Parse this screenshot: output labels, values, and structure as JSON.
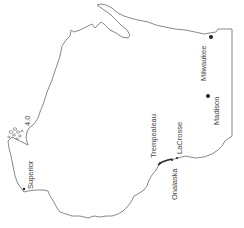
{
  "map": {
    "region": "Wisconsin",
    "orientation": "rotated 90 degrees counter-clockwise",
    "colors": {
      "outline": "#7a7a7a",
      "dot": "#222222",
      "label": "#444444",
      "background": "#ffffff"
    },
    "cities": [
      {
        "name": "Superior",
        "x": 24,
        "y": 189,
        "r": 1.2,
        "label_x": 31,
        "label_y": 189
      },
      {
        "name": "Milwaukee",
        "x": 210,
        "y": 37,
        "r": 2.0,
        "label_x": 205,
        "label_y": 82
      },
      {
        "name": "Madison",
        "x": 208,
        "y": 96,
        "r": 2.0,
        "label_x": 218,
        "label_y": 125
      },
      {
        "name": "Trempealeau",
        "x": 159,
        "y": 161,
        "r": 1.0,
        "label_x": 155,
        "label_y": 157
      },
      {
        "name": "LaCrosse",
        "x": 176,
        "y": 157,
        "r": 1.0,
        "label_x": 180,
        "label_y": 153
      },
      {
        "name": "Onalaska",
        "x": 172,
        "y": 160,
        "r": 1.0,
        "label_x": 176,
        "label_y": 200
      }
    ],
    "lake_label_fragment": "4.0"
  }
}
